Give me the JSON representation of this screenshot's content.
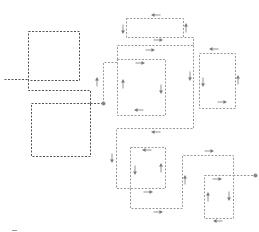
{
  "diagram": {
    "width": 259,
    "height": 232,
    "colors": {
      "dark_box": "#555555",
      "light_path": "#9a9a9a",
      "arrow": "#777777",
      "dot": "#888888"
    },
    "dark_boxes": [
      {
        "id": "block-a",
        "x": 28,
        "y": 31,
        "w": 51,
        "h": 49
      },
      {
        "id": "block-b",
        "x": 31,
        "y": 103,
        "w": 59,
        "h": 53
      }
    ],
    "dark_lines": [
      {
        "id": "input-lead",
        "points": [
          [
            4,
            79
          ],
          [
            28,
            79
          ]
        ]
      },
      {
        "id": "block-a-tail",
        "points": [
          [
            28,
            79
          ],
          [
            28,
            90
          ],
          [
            90,
            90
          ],
          [
            90,
            103
          ]
        ]
      },
      {
        "id": "block-b-link",
        "points": [
          [
            90,
            103
          ],
          [
            103,
            103
          ]
        ]
      }
    ],
    "light_boxes": [
      {
        "id": "loop-top",
        "x": 126,
        "y": 18,
        "w": 57,
        "h": 19
      },
      {
        "id": "loop-mid",
        "x": 117,
        "y": 59,
        "w": 48,
        "h": 56
      },
      {
        "id": "loop-right",
        "x": 199,
        "y": 53,
        "w": 36,
        "h": 55
      },
      {
        "id": "loop-lower-mid",
        "x": 130,
        "y": 147,
        "w": 35,
        "h": 41
      },
      {
        "id": "loop-lower-right",
        "x": 204,
        "y": 175,
        "w": 29,
        "h": 43
      }
    ],
    "light_paths": [
      {
        "id": "route-1",
        "points": [
          [
            103,
            103
          ],
          [
            103,
            62
          ],
          [
            117,
            62
          ]
        ]
      },
      {
        "id": "route-2",
        "points": [
          [
            117,
            59
          ],
          [
            117,
            45
          ],
          [
            193,
            45
          ],
          [
            193,
            37
          ],
          [
            183,
            37
          ]
        ]
      },
      {
        "id": "route-3",
        "points": [
          [
            193,
            45
          ],
          [
            193,
            128
          ],
          [
            116,
            128
          ],
          [
            116,
            188
          ],
          [
            130,
            188
          ]
        ]
      },
      {
        "id": "route-4",
        "points": [
          [
            130,
            188
          ],
          [
            130,
            208
          ],
          [
            182,
            208
          ],
          [
            182,
            155
          ],
          [
            233,
            155
          ],
          [
            233,
            175
          ]
        ]
      },
      {
        "id": "route-5",
        "points": [
          [
            233,
            175
          ],
          [
            255,
            175
          ]
        ]
      }
    ],
    "arrows": [
      {
        "x": 156,
        "y": 15,
        "dir": "left"
      },
      {
        "x": 123,
        "y": 29,
        "dir": "down"
      },
      {
        "x": 186,
        "y": 28,
        "dir": "up"
      },
      {
        "x": 158,
        "y": 40,
        "dir": "right"
      },
      {
        "x": 150,
        "y": 50,
        "dir": "right"
      },
      {
        "x": 97,
        "y": 82,
        "dir": "up"
      },
      {
        "x": 140,
        "y": 63,
        "dir": "right"
      },
      {
        "x": 123,
        "y": 84,
        "dir": "up"
      },
      {
        "x": 161,
        "y": 89,
        "dir": "down"
      },
      {
        "x": 139,
        "y": 110,
        "dir": "left"
      },
      {
        "x": 190,
        "y": 76,
        "dir": "down"
      },
      {
        "x": 214,
        "y": 49,
        "dir": "left"
      },
      {
        "x": 203,
        "y": 82,
        "dir": "down"
      },
      {
        "x": 238,
        "y": 80,
        "dir": "up"
      },
      {
        "x": 222,
        "y": 102,
        "dir": "right"
      },
      {
        "x": 156,
        "y": 132,
        "dir": "left"
      },
      {
        "x": 112,
        "y": 158,
        "dir": "down"
      },
      {
        "x": 147,
        "y": 150,
        "dir": "left"
      },
      {
        "x": 135,
        "y": 170,
        "dir": "down"
      },
      {
        "x": 161,
        "y": 168,
        "dir": "up"
      },
      {
        "x": 148,
        "y": 192,
        "dir": "right"
      },
      {
        "x": 158,
        "y": 212,
        "dir": "right"
      },
      {
        "x": 185,
        "y": 180,
        "dir": "up"
      },
      {
        "x": 209,
        "y": 151,
        "dir": "right"
      },
      {
        "x": 217,
        "y": 179,
        "dir": "right"
      },
      {
        "x": 208,
        "y": 197,
        "dir": "up"
      },
      {
        "x": 229,
        "y": 196,
        "dir": "down"
      },
      {
        "x": 218,
        "y": 221,
        "dir": "left"
      }
    ],
    "dots": [
      {
        "id": "junction-main",
        "x": 103,
        "y": 103
      },
      {
        "id": "terminal-out",
        "x": 255,
        "y": 175
      }
    ],
    "footnote_mark": {
      "x": 12,
      "y": 230,
      "w": 5,
      "h": 1
    }
  }
}
